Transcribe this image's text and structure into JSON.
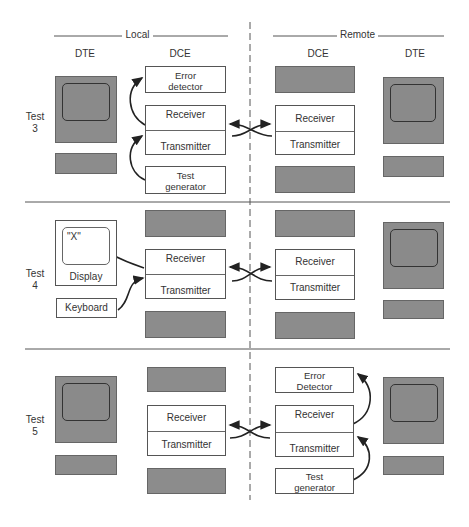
{
  "headers": {
    "local": "Local",
    "remote": "Remote",
    "local_dte": "DTE",
    "local_dce": "DCE",
    "remote_dce": "DCE",
    "remote_dte": "DTE"
  },
  "tests": [
    {
      "label_line1": "Test",
      "label_line2": "3",
      "local_dce_top": "Error detector",
      "local_dce_top_l1": "Error",
      "local_dce_top_l2": "detector",
      "receiver": "Receiver",
      "transmitter": "Transmitter",
      "local_dce_bottom_l1": "Test",
      "local_dce_bottom_l2": "generator",
      "remote_receiver": "Receiver",
      "remote_transmitter": "Transmitter"
    },
    {
      "label_line1": "Test",
      "label_line2": "4",
      "display_char": "\"X\"",
      "display_label": "Display",
      "keyboard_label": "Keyboard",
      "receiver": "Receiver",
      "transmitter": "Transmitter",
      "remote_receiver": "Receiver",
      "remote_transmitter": "Transmitter"
    },
    {
      "label_line1": "Test",
      "label_line2": "5",
      "receiver": "Receiver",
      "transmitter": "Transmitter",
      "remote_receiver": "Receiver",
      "remote_transmitter": "Transmitter",
      "remote_dce_top_l1": "Error",
      "remote_dce_top_l2": "Detector",
      "remote_dce_bottom_l1": "Test",
      "remote_dce_bottom_l2": "generator"
    }
  ],
  "colors": {
    "shade": "#8c8c8c",
    "line": "#333333"
  }
}
